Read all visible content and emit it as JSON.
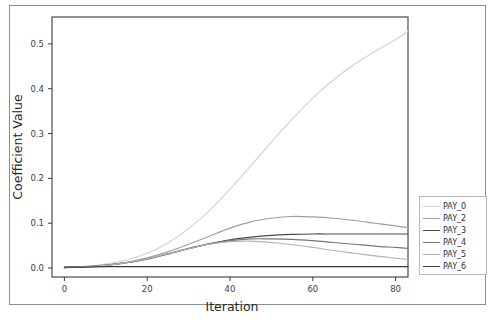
{
  "figure": {
    "background": "#ffffff",
    "frame_color": "#8d8d8d"
  },
  "chart_data": {
    "type": "line",
    "title": "",
    "xlabel": "Iteration",
    "ylabel": "Coefficient Value",
    "xlim": [
      -3,
      83
    ],
    "ylim": [
      -0.02,
      0.56
    ],
    "xticks": [
      0,
      20,
      40,
      60,
      80
    ],
    "xticklabels": [
      "0",
      "20",
      "40",
      "60",
      "80"
    ],
    "yticks": [
      0.0,
      0.1,
      0.2,
      0.3,
      0.4,
      0.5
    ],
    "yticklabels": [
      "0.0",
      "0.1",
      "0.2",
      "0.3",
      "0.4",
      "0.5"
    ],
    "grid": false,
    "legend_position": "outside right",
    "x": [
      0,
      5,
      10,
      15,
      20,
      25,
      30,
      35,
      40,
      45,
      50,
      55,
      60,
      65,
      70,
      75,
      80,
      83
    ],
    "series": [
      {
        "name": "PAY_0",
        "color": "#d2d2d2",
        "values": [
          0.002,
          0.004,
          0.009,
          0.018,
          0.033,
          0.056,
          0.088,
          0.128,
          0.176,
          0.228,
          0.281,
          0.332,
          0.379,
          0.42,
          0.454,
          0.483,
          0.51,
          0.528
        ]
      },
      {
        "name": "PAY_2",
        "color": "#9e9e9e",
        "values": [
          0.001,
          0.003,
          0.007,
          0.013,
          0.023,
          0.036,
          0.053,
          0.071,
          0.089,
          0.103,
          0.111,
          0.115,
          0.114,
          0.111,
          0.106,
          0.1,
          0.094,
          0.09
        ]
      },
      {
        "name": "PAY_3",
        "color": "#4a4a4a",
        "values": [
          0.001,
          0.003,
          0.006,
          0.012,
          0.02,
          0.031,
          0.043,
          0.054,
          0.063,
          0.069,
          0.073,
          0.075,
          0.076,
          0.076,
          0.076,
          0.076,
          0.076,
          0.076
        ]
      },
      {
        "name": "PAY_4",
        "color": "#777777",
        "values": [
          0.001,
          0.003,
          0.006,
          0.012,
          0.021,
          0.032,
          0.044,
          0.054,
          0.061,
          0.065,
          0.065,
          0.064,
          0.061,
          0.057,
          0.053,
          0.049,
          0.046,
          0.044
        ]
      },
      {
        "name": "PAY_5",
        "color": "#b4b4b4",
        "values": [
          0.001,
          0.003,
          0.006,
          0.012,
          0.021,
          0.032,
          0.043,
          0.053,
          0.059,
          0.06,
          0.057,
          0.052,
          0.046,
          0.039,
          0.033,
          0.027,
          0.022,
          0.019
        ]
      },
      {
        "name": "PAY_6",
        "color": "#3a3a3a",
        "values": [
          0.002,
          0.002,
          0.003,
          0.003,
          0.003,
          0.003,
          0.003,
          0.003,
          0.003,
          0.003,
          0.003,
          0.003,
          0.003,
          0.003,
          0.003,
          0.003,
          0.003,
          0.003
        ]
      }
    ]
  },
  "legend": {
    "items": [
      {
        "label": "PAY_0",
        "color": "#d2d2d2"
      },
      {
        "label": "PAY_2",
        "color": "#9e9e9e"
      },
      {
        "label": "PAY_3",
        "color": "#4a4a4a"
      },
      {
        "label": "PAY_4",
        "color": "#777777"
      },
      {
        "label": "PAY_5",
        "color": "#b4b4b4"
      },
      {
        "label": "PAY_6",
        "color": "#3a3a3a"
      }
    ]
  }
}
